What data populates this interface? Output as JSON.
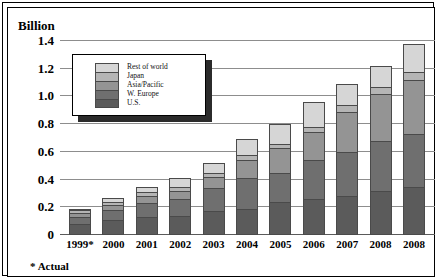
{
  "chart_data": {
    "type": "bar",
    "stacked": true,
    "title": "",
    "xlabel": "",
    "ylabel": "Billion",
    "ylim": [
      0,
      1.4
    ],
    "yticks": [
      "0",
      "0.2",
      "0.4",
      "0.6",
      "0.8",
      "1.0",
      "1.2",
      "1.4"
    ],
    "ytick_values": [
      0,
      0.2,
      0.4,
      0.6,
      0.8,
      1.0,
      1.2,
      1.4
    ],
    "grid": true,
    "legend_position": "upper-left-inside",
    "categories": [
      "1999*",
      "2000",
      "2001",
      "2002",
      "2003",
      "2004",
      "2005",
      "2006",
      "2007",
      "2008",
      "2008"
    ],
    "series": [
      {
        "name": "U.S.",
        "color": "#5b5b5b",
        "values": [
          0.08,
          0.11,
          0.13,
          0.14,
          0.17,
          0.19,
          0.24,
          0.26,
          0.28,
          0.32,
          0.35
        ]
      },
      {
        "name": "W. Europe",
        "color": "#6f6f6f",
        "values": [
          0.05,
          0.07,
          0.1,
          0.12,
          0.17,
          0.22,
          0.21,
          0.28,
          0.32,
          0.36,
          0.38
        ]
      },
      {
        "name": "Asia/Pacific",
        "color": "#949494",
        "values": [
          0.03,
          0.04,
          0.05,
          0.06,
          0.08,
          0.13,
          0.18,
          0.2,
          0.29,
          0.34,
          0.39
        ]
      },
      {
        "name": "Japan",
        "color": "#b5b5b5",
        "values": [
          0.02,
          0.02,
          0.03,
          0.03,
          0.03,
          0.04,
          0.03,
          0.04,
          0.05,
          0.05,
          0.06
        ]
      },
      {
        "name": "Rest of world",
        "color": "#d6d6d6",
        "values": [
          0.01,
          0.03,
          0.04,
          0.06,
          0.07,
          0.11,
          0.14,
          0.18,
          0.15,
          0.15,
          0.2
        ]
      }
    ],
    "totals": [
      0.19,
      0.27,
      0.35,
      0.41,
      0.52,
      0.69,
      0.8,
      0.96,
      1.09,
      1.22,
      1.38
    ],
    "annotations": [
      "* Actual"
    ]
  },
  "axis": {
    "y_title": "Billion"
  },
  "legend": {
    "items": [
      {
        "label": "Rest of world"
      },
      {
        "label": "Japan"
      },
      {
        "label": "Asia/Pacific"
      },
      {
        "label": "W. Europe"
      },
      {
        "label": "U.S."
      }
    ]
  },
  "footnote": {
    "text": "* Actual"
  }
}
